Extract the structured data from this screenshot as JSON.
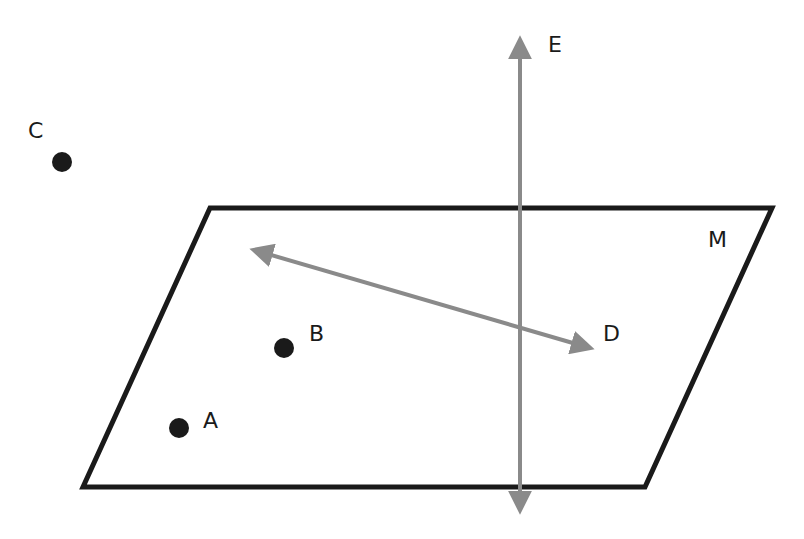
{
  "diagram": {
    "plane": {
      "label": "M",
      "corners": [
        [
          210,
          208
        ],
        [
          772,
          208
        ],
        [
          645,
          487
        ],
        [
          83,
          487
        ]
      ],
      "stroke": "#1a1a1a"
    },
    "lines": [
      {
        "name": "E",
        "label": "E",
        "from": [
          520,
          32
        ],
        "to": [
          520,
          518
        ],
        "color": "#8a8a8a"
      },
      {
        "name": "D",
        "label": "D",
        "from": [
          248,
          248
        ],
        "to": [
          597,
          350
        ],
        "color": "#8a8a8a"
      }
    ],
    "points": [
      {
        "label": "C",
        "x": 62,
        "y": 162
      },
      {
        "label": "B",
        "x": 284,
        "y": 348
      },
      {
        "label": "A",
        "x": 179,
        "y": 428
      }
    ]
  }
}
